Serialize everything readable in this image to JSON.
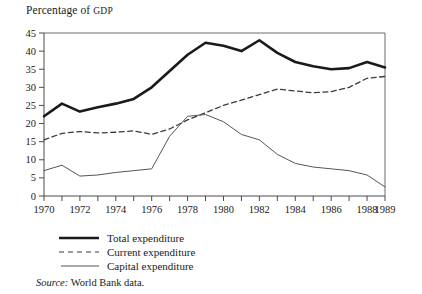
{
  "figure": {
    "axis_title_main": "Percentage of ",
    "axis_title_smallcaps": "GDP",
    "source_prefix": "Source:",
    "source_text": " World Bank data."
  },
  "legend": {
    "position": "below-axis-left",
    "items": [
      {
        "label": "Total expenditure",
        "style": "solid-thick",
        "color": "#1a1a1a",
        "width": 2.6
      },
      {
        "label": "Current expenditure",
        "style": "dashed",
        "color": "#3a3a3a",
        "width": 1.2
      },
      {
        "label": "Capital expenditure",
        "style": "solid-thin",
        "color": "#555555",
        "width": 1.0
      }
    ]
  },
  "chart_data": {
    "type": "line",
    "title": "Percentage of GDP",
    "xlabel": "",
    "ylabel": "Percentage of GDP",
    "xlim": [
      1970,
      1989
    ],
    "ylim": [
      0,
      45
    ],
    "ytick_step": 5,
    "yticks": [
      0,
      5,
      10,
      15,
      20,
      25,
      30,
      35,
      40,
      45
    ],
    "ytick_labels": [
      "0",
      "5",
      "10",
      "15",
      "20",
      "25",
      "30",
      "35",
      "40",
      "45"
    ],
    "x": [
      1970,
      1971,
      1972,
      1973,
      1974,
      1975,
      1976,
      1977,
      1978,
      1979,
      1980,
      1981,
      1982,
      1983,
      1984,
      1985,
      1986,
      1987,
      1988,
      1989
    ],
    "xticks": [
      1970,
      1971,
      1972,
      1973,
      1974,
      1975,
      1976,
      1977,
      1978,
      1979,
      1980,
      1981,
      1982,
      1983,
      1984,
      1985,
      1986,
      1987,
      1988,
      1989
    ],
    "xtick_labels_shown": [
      "1970",
      "1972",
      "1974",
      "1976",
      "1978",
      "1980",
      "1982",
      "1984",
      "1986",
      "1988",
      "1989"
    ],
    "grid": false,
    "legend_position": "below",
    "series": [
      {
        "name": "Total expenditure",
        "style": "solid-thick",
        "color": "#1a1a1a",
        "values": [
          22.0,
          25.5,
          23.3,
          24.5,
          25.5,
          26.8,
          30.0,
          34.5,
          39.0,
          42.3,
          41.5,
          40.0,
          43.0,
          39.5,
          37.0,
          35.8,
          35.0,
          35.3,
          37.0,
          35.5
        ]
      },
      {
        "name": "Current expenditure",
        "style": "dashed",
        "color": "#3a3a3a",
        "values": [
          15.5,
          17.3,
          17.8,
          17.4,
          17.6,
          18.0,
          17.0,
          18.5,
          21.0,
          23.0,
          25.0,
          26.5,
          28.0,
          29.5,
          29.0,
          28.5,
          28.8,
          30.0,
          32.5,
          33.0
        ]
      },
      {
        "name": "Capital expenditure",
        "style": "solid-thin",
        "color": "#555555",
        "values": [
          7.0,
          8.5,
          5.5,
          5.8,
          6.5,
          7.0,
          7.5,
          16.5,
          22.0,
          22.5,
          20.5,
          17.0,
          15.5,
          11.5,
          9.0,
          8.0,
          7.5,
          7.0,
          5.8,
          2.5
        ]
      }
    ]
  }
}
